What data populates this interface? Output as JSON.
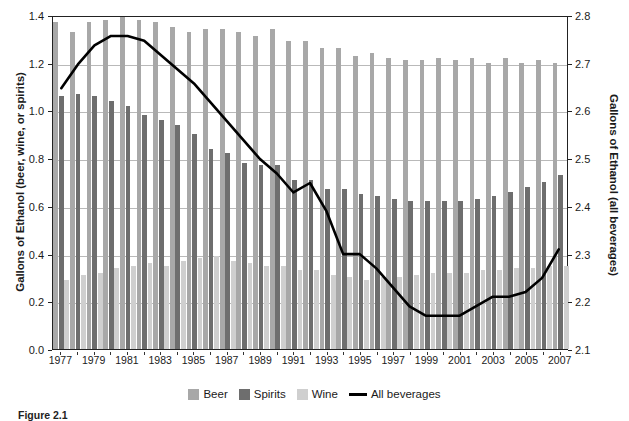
{
  "chart_data": {
    "type": "bar",
    "title": "",
    "xlabel": "",
    "ylabel": "Gallons of Ethanol (beer, wine, or spirits)",
    "ylabel_right": "Gallons of Ethanol (all beverages)",
    "ylim": [
      0,
      1.4
    ],
    "ylim_right": [
      2.1,
      2.8
    ],
    "yticks": [
      "0.0",
      "0.2",
      "0.4",
      "0.6",
      "0.8",
      "1.0",
      "1.2",
      "1.4"
    ],
    "yticks_right": [
      "2.1",
      "2.2",
      "2.3",
      "2.4",
      "2.5",
      "2.6",
      "2.7",
      "2.8"
    ],
    "grid": true,
    "legend_position": "bottom",
    "categories": [
      1977,
      1978,
      1979,
      1980,
      1981,
      1982,
      1983,
      1984,
      1985,
      1986,
      1987,
      1988,
      1989,
      1990,
      1991,
      1992,
      1993,
      1994,
      1995,
      1996,
      1997,
      1998,
      1999,
      2000,
      2001,
      2002,
      2003,
      2004,
      2005,
      2006,
      2007
    ],
    "xtick_labels": [
      "1977",
      "1979",
      "1981",
      "1983",
      "1985",
      "1987",
      "1989",
      "1991",
      "1993",
      "1995",
      "1997",
      "1999",
      "2001",
      "2003",
      "2005",
      "2007"
    ],
    "series": [
      {
        "name": "Beer",
        "kind": "bar",
        "axis": "left",
        "color": "#a8a8a8",
        "values": [
          1.37,
          1.33,
          1.37,
          1.38,
          1.39,
          1.38,
          1.37,
          1.35,
          1.33,
          1.34,
          1.34,
          1.33,
          1.31,
          1.34,
          1.29,
          1.29,
          1.26,
          1.26,
          1.23,
          1.24,
          1.22,
          1.21,
          1.21,
          1.22,
          1.21,
          1.22,
          1.2,
          1.22,
          1.2,
          1.21,
          1.2
        ]
      },
      {
        "name": "Spirits",
        "kind": "bar",
        "axis": "left",
        "color": "#6e6e6e",
        "values": [
          1.06,
          1.07,
          1.06,
          1.04,
          1.02,
          0.98,
          0.96,
          0.94,
          0.9,
          0.84,
          0.82,
          0.78,
          0.77,
          0.77,
          0.71,
          0.71,
          0.67,
          0.67,
          0.65,
          0.64,
          0.63,
          0.62,
          0.62,
          0.62,
          0.62,
          0.63,
          0.64,
          0.66,
          0.68,
          0.7,
          0.73
        ]
      },
      {
        "name": "Wine",
        "kind": "bar",
        "axis": "left",
        "color": "#cfcfcf",
        "values": [
          0.29,
          0.31,
          0.32,
          0.34,
          0.35,
          0.36,
          0.35,
          0.37,
          0.38,
          0.39,
          0.37,
          0.36,
          0.35,
          0.35,
          0.33,
          0.33,
          0.31,
          0.3,
          0.29,
          0.3,
          0.3,
          0.31,
          0.32,
          0.32,
          0.32,
          0.33,
          0.33,
          0.34,
          0.34,
          0.35,
          0.35
        ]
      },
      {
        "name": "All beverages",
        "kind": "line",
        "axis": "right",
        "color": "#000000",
        "values": [
          2.65,
          2.7,
          2.74,
          2.76,
          2.76,
          2.75,
          2.72,
          2.69,
          2.66,
          2.62,
          2.58,
          2.54,
          2.5,
          2.47,
          2.43,
          2.45,
          2.39,
          2.3,
          2.3,
          2.27,
          2.23,
          2.19,
          2.17,
          2.17,
          2.17,
          2.19,
          2.21,
          2.21,
          2.22,
          2.25,
          2.31
        ]
      }
    ]
  },
  "axes": {
    "left_title": "Gallons of Ethanol (beer, wine, or spirits)",
    "right_title": "Gallons of Ethanol (all beverages)"
  },
  "legend": {
    "items": [
      {
        "label": "Beer",
        "swatch": "beer"
      },
      {
        "label": "Spirits",
        "swatch": "spirits"
      },
      {
        "label": "Wine",
        "swatch": "wine"
      },
      {
        "label": "All beverages",
        "swatch": "line"
      }
    ]
  },
  "caption": {
    "figure_number": "Figure 2.1",
    "text": ""
  }
}
